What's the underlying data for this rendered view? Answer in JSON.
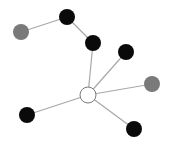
{
  "diagram": {
    "type": "network-graph",
    "colors": {
      "black_node": "#0a0a0a",
      "gray_node": "#7a7a7a",
      "white_node_fill": "#ffffff",
      "white_node_stroke": "#7a7a7a",
      "edge": "#a8a8a8"
    },
    "nodes": [
      {
        "id": "n1",
        "kind": "gray",
        "x": 21,
        "y": 32,
        "r": 8
      },
      {
        "id": "n2",
        "kind": "black",
        "x": 67,
        "y": 17,
        "r": 8
      },
      {
        "id": "n3",
        "kind": "black",
        "x": 93,
        "y": 43,
        "r": 8
      },
      {
        "id": "n4",
        "kind": "black",
        "x": 126,
        "y": 52,
        "r": 8
      },
      {
        "id": "n5",
        "kind": "gray",
        "x": 152,
        "y": 84,
        "r": 8
      },
      {
        "id": "hub",
        "kind": "white",
        "x": 88,
        "y": 95,
        "r": 8
      },
      {
        "id": "n6",
        "kind": "black",
        "x": 27,
        "y": 115,
        "r": 8
      },
      {
        "id": "n7",
        "kind": "black",
        "x": 134,
        "y": 129,
        "r": 8
      }
    ],
    "edges": [
      [
        "n1",
        "n2"
      ],
      [
        "n2",
        "n3"
      ],
      [
        "n3",
        "hub"
      ],
      [
        "n4",
        "hub"
      ],
      [
        "n5",
        "hub"
      ],
      [
        "n6",
        "hub"
      ],
      [
        "n7",
        "hub"
      ]
    ]
  }
}
